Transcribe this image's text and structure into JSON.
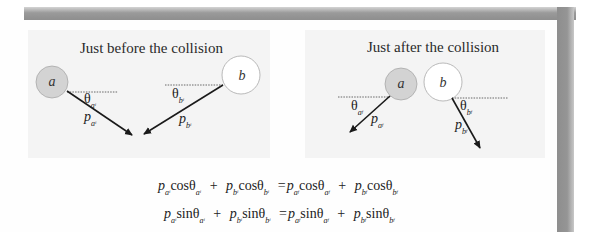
{
  "panels": {
    "before": {
      "title": "Just before the collision",
      "ball_a": "a",
      "ball_b": "b",
      "theta_a": "θ",
      "theta_a_sub": "a",
      "theta_a_sub2": "i",
      "theta_b": "θ",
      "theta_b_sub": "b",
      "theta_b_sub2": "i",
      "p_a": "p",
      "p_a_sub": "a",
      "p_a_sub2": "i",
      "p_b": "p",
      "p_b_sub": "b",
      "p_b_sub2": "i"
    },
    "after": {
      "title": "Just after the collision",
      "ball_a": "a",
      "ball_b": "b",
      "theta_a": "θ",
      "theta_a_sub": "a",
      "theta_a_sub2": "f",
      "theta_b": "θ",
      "theta_b_sub": "b",
      "theta_b_sub2": "f",
      "p_a": "p",
      "p_a_sub": "a",
      "p_a_sub2": "f",
      "p_b": "p",
      "p_b_sub": "b",
      "p_b_sub2": "f"
    }
  },
  "equations": [
    {
      "terms": [
        {
          "p": "p",
          "ps": "a",
          "ps2": "i",
          "fn": "cosθ",
          "ts": "a",
          "ts2": "i"
        },
        {
          "p": "p",
          "ps": "b",
          "ps2": "i",
          "fn": "cosθ",
          "ts": "b",
          "ts2": "i"
        },
        {
          "p": "p",
          "ps": "a",
          "ps2": "f",
          "fn": "cosθ",
          "ts": "a",
          "ts2": "f"
        },
        {
          "p": "p",
          "ps": "b",
          "ps2": "f",
          "fn": "cosθ",
          "ts": "b",
          "ts2": "f"
        }
      ],
      "plus": "+",
      "equals": "="
    },
    {
      "terms": [
        {
          "p": "p",
          "ps": "a",
          "ps2": "i",
          "fn": "sinθ",
          "ts": "a",
          "ts2": "i"
        },
        {
          "p": "p",
          "ps": "b",
          "ps2": "i",
          "fn": "sinθ",
          "ts": "b",
          "ts2": "i"
        },
        {
          "p": "p",
          "ps": "a",
          "ps2": "f",
          "fn": "sinθ",
          "ts": "a",
          "ts2": "f"
        },
        {
          "p": "p",
          "ps": "b",
          "ps2": "f",
          "fn": "sinθ",
          "ts": "b",
          "ts2": "f"
        }
      ],
      "plus": "+",
      "equals": "="
    }
  ],
  "colors": {
    "ball_a_fill": "#d3d3d3",
    "ball_b_fill": "#ffffff",
    "panel_bg": "#f4f4f4",
    "arrow": "#1a1a1a",
    "frame_shadow": "#909090"
  }
}
